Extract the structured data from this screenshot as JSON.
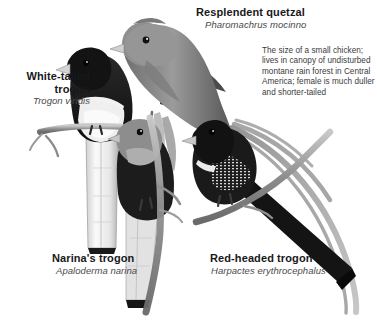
{
  "plate": {
    "title": "Trogons comparative plate",
    "background_color": "#ffffff",
    "text_color": "#18181a",
    "sci_color": "#4a4a4c",
    "desc_color": "#3b3b3d"
  },
  "species": [
    {
      "id": "resplendent-quetzal",
      "common_name": "Resplendent quetzal",
      "scientific_name": "Pharomachrus mocinno",
      "description": "The size of a small chicken; lives in canopy of undisturbed montane rain forest in Central America; female is much duller and shorter-tailed"
    },
    {
      "id": "white-tailed-trogon",
      "common_name": "White-tailed\ntrogon",
      "scientific_name": "Trogon viridis",
      "description": ""
    },
    {
      "id": "narinas-trogon",
      "common_name": "Narina's trogon",
      "scientific_name": "Apaloderma narina",
      "description": ""
    },
    {
      "id": "red-headed-trogon",
      "common_name": "Red-headed trogon",
      "scientific_name": "Harpactes erythrocephalus",
      "description": ""
    }
  ],
  "illustration": {
    "style": "grayscale halftone bird illustrations",
    "figure_labels": [
      "quetzal-figure",
      "white-tailed-trogon-figure",
      "narina-trogon-figure",
      "red-headed-trogon-figure"
    ]
  }
}
